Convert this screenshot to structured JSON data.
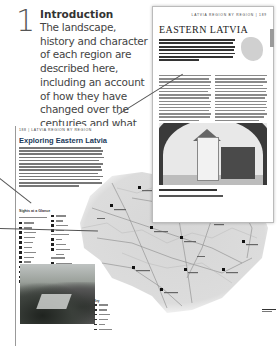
{
  "callout": {
    "number": "1",
    "title": "Introduction",
    "body": "The landscape, history and character of each region are described here, including an account of how they have changed over the centuries and what they have to offer to the visitor today."
  },
  "right_page": {
    "running_header": "LATVIA REGION BY REGION  |  189",
    "title": "EASTERN LATVIA"
  },
  "left_page": {
    "running_header": "188  |  LATVIA REGION BY REGION",
    "title": "Exploring Eastern Latvia",
    "legend_title": "Sights at a Glance",
    "legend_subhead": "Towns, Resorts & Villages",
    "key_title": "Key"
  },
  "colors": {
    "title_blue": "#1b3a5a",
    "map_fill": "#d9d9d9",
    "map_roads": "#8a8a8a",
    "text_gray": "#444444"
  }
}
